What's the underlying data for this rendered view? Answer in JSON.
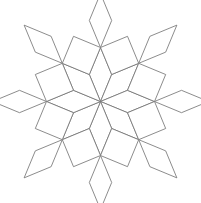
{
  "figure": {
    "name": "eight-fold-rhombus-rosette",
    "type": "geometric-line-drawing",
    "title": "",
    "caption": "",
    "background_color": "#ffffff",
    "stroke_color": "#6e6e6e",
    "fill_color": "#ffffff",
    "stroke_width": 0.8,
    "symmetry_order": 8,
    "canvas": {
      "width": 201,
      "height": 203
    },
    "center": {
      "x": 100.5,
      "y": 101.5
    },
    "rotation_offset_deg": -90,
    "rings": [
      {
        "name": "inner-ring",
        "label": "inner thin rhombi",
        "count": 8,
        "shape": "rhombus",
        "inner_radius": 0,
        "outer_radius": 54,
        "half_angle_deg": 22.5
      },
      {
        "name": "middle-ring",
        "label": "petal rhombi",
        "count": 8,
        "shape": "rhombus",
        "inner_radius": 54,
        "outer_radius": 84,
        "half_angle_deg": 22.5
      },
      {
        "name": "outer-ring",
        "label": "outer squares",
        "count": 8,
        "shape": "square",
        "inner_radius": 54,
        "outer_radius": 84,
        "half_angle_deg": 22.5
      }
    ],
    "vertices_of_note": [
      {
        "name": "center",
        "x": 100.5,
        "y": 101.5
      },
      {
        "name": "top-apex",
        "x": 100.5,
        "y": 17.5
      },
      {
        "name": "bottom-apex",
        "x": 100.5,
        "y": 185.5
      },
      {
        "name": "left-junction",
        "x": 25.5,
        "y": 101.5
      },
      {
        "name": "right-junction",
        "x": 175.5,
        "y": 101.5
      },
      {
        "name": "upper-left-junction",
        "x": 47.5,
        "y": 48.5
      },
      {
        "name": "upper-right-junction",
        "x": 153.5,
        "y": 48.5
      },
      {
        "name": "lower-left-junction",
        "x": 47.5,
        "y": 154.5
      },
      {
        "name": "lower-right-junction",
        "x": 153.5,
        "y": 154.5
      }
    ]
  }
}
